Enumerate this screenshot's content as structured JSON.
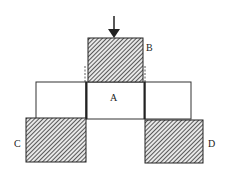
{
  "diagram": {
    "labels": {
      "A": "A",
      "B": "B",
      "C": "C",
      "D": "D"
    },
    "blocks": [
      {
        "id": "B",
        "fill": "hatched",
        "position": "top-center"
      },
      {
        "id": "A",
        "fill": "white",
        "position": "middle-center"
      },
      {
        "id": "left-white",
        "fill": "white",
        "position": "middle-left"
      },
      {
        "id": "right-white",
        "fill": "white",
        "position": "middle-right"
      },
      {
        "id": "C",
        "fill": "hatched",
        "position": "bottom-left"
      },
      {
        "id": "D",
        "fill": "hatched",
        "position": "bottom-right"
      }
    ],
    "arrow": {
      "direction": "down",
      "target": "B"
    },
    "colors": {
      "stroke": "#222222",
      "hatch": "#333333",
      "background": "#ffffff"
    }
  }
}
